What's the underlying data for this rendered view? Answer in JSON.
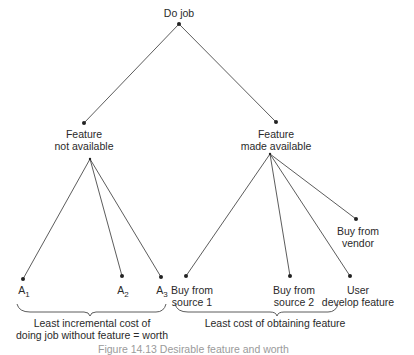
{
  "root": {
    "label": "Do job"
  },
  "branches": {
    "left": {
      "label_line1": "Feature",
      "label_line2": "not available"
    },
    "right": {
      "label_line1": "Feature",
      "label_line2": "made available"
    }
  },
  "leaves": {
    "a1": {
      "base": "A",
      "sub": "1"
    },
    "a2": {
      "base": "A",
      "sub": "2"
    },
    "a3": {
      "base": "A",
      "sub": "3"
    },
    "source1": {
      "line1": "Buy from",
      "line2": "source 1"
    },
    "source2": {
      "line1": "Buy from",
      "line2": "source 2"
    },
    "user": {
      "line1": "User",
      "line2": "develop feature"
    },
    "vendor": {
      "line1": "Buy from",
      "line2": "vendor"
    }
  },
  "braces": {
    "left": {
      "line1": "Least incremental cost of",
      "line2": "doing job without feature = worth"
    },
    "right": {
      "line1": "Least cost of obtaining feature"
    }
  },
  "caption": "Figure 14.13   Desirable feature and worth"
}
